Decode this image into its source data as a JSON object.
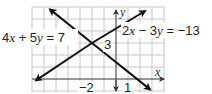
{
  "figure": {
    "type": "system-of-linear-equations-graph",
    "equations": [
      {
        "id": "line1",
        "label": "4x + 5y = 7",
        "label_parts": [
          "4",
          "x",
          " + 5",
          "y",
          " = 7"
        ]
      },
      {
        "id": "line2",
        "label": "2x − 3y = −13",
        "label_parts": [
          "2",
          "x",
          " − 3",
          "y",
          " = −13"
        ]
      }
    ],
    "axes": {
      "x_label": "x",
      "y_label": "y"
    },
    "tick_labels": {
      "x_neg2": "−2",
      "x_1": "1",
      "y_3": "3"
    },
    "intersection": {
      "x": -2,
      "y": 3
    },
    "colors": {
      "grid": "#c8c8c8",
      "axis": "#333333",
      "line": "#111111"
    }
  }
}
